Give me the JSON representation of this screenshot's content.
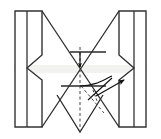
{
  "figure": {
    "title": "Origami folding step diagram",
    "canvas": {
      "width": 161,
      "height": 139,
      "background": "#ffffff"
    },
    "colors": {
      "stroke": "#222222",
      "stroke_light": "#555555",
      "dashed": "#333333",
      "fill_paper": "#ffffff",
      "fill_shade": "#f2f3f1",
      "arrow": "#111111"
    },
    "strokes": {
      "outline_width": 1.4,
      "fold_width": 1.2,
      "dash_width": 1.0,
      "dash_pattern": "3,2.5"
    },
    "shapes": {
      "left_strip": {
        "name": "left-side-strip",
        "points": "15,11 42,11 42,55 27,68 42,80 42,127 15,127"
      },
      "left_strip_inner_edge": {
        "name": "left-strip-inner-fold",
        "points": "27,11 27,127"
      },
      "left_flap_top": {
        "name": "left-top-flap",
        "points": "42,11 80,68"
      },
      "left_flap_bottom": {
        "name": "left-bottom-flap",
        "points": "42,127 80,68"
      },
      "right_strip": {
        "name": "right-side-strip",
        "points": "146,11 119,11 119,55 134,68 119,80 119,127 146,127"
      },
      "right_strip_inner_edge": {
        "name": "right-strip-inner-fold",
        "points": "134,11 134,127"
      },
      "right_flap_top": {
        "name": "right-top-flap",
        "points": "119,11 80,68"
      },
      "right_flap_bottom": {
        "name": "right-bottom-flap",
        "points": "119,127 80,68"
      },
      "bottom_v": {
        "name": "bottom-v-flap",
        "points": "57,95 80,132 103,95"
      },
      "center_shade": {
        "name": "center-shaded-band",
        "points": "15,66 146,66 146,72 15,72"
      },
      "upper_bar": {
        "name": "upper-horizontal-crease",
        "points": "70,52 105,52"
      },
      "lower_bar": {
        "name": "lower-horizontal-crease",
        "points": "62,86 105,86"
      }
    },
    "creases": [
      {
        "name": "vertical-center-dashed",
        "points": "80,48 80,132",
        "style": "dashed"
      },
      {
        "name": "diagonal-dashed-right",
        "points": "80,86 103,112",
        "style": "dashed"
      },
      {
        "name": "short-dashed-tick",
        "points": "92,90 96,100",
        "style": "dashed"
      }
    ],
    "arrows": [
      {
        "name": "down-arrow-center",
        "from": "80,52",
        "to": "80,68",
        "style": "straight",
        "direction": "down"
      },
      {
        "name": "curved-arrow-right",
        "from": "80,86",
        "to": "122,85",
        "style": "curved",
        "direction": "right"
      },
      {
        "name": "fold-arrow-diagonal",
        "from": "88,99",
        "to": "112,82",
        "style": "straight",
        "direction": "up-right"
      }
    ],
    "labels": []
  }
}
